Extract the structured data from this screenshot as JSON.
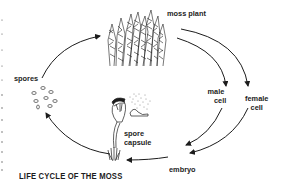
{
  "diagram": {
    "title": "LIFE CYCLE OF THE MOSS",
    "stages": [
      {
        "id": "moss-plant",
        "label": "moss plant"
      },
      {
        "id": "male-cell",
        "label_line1": "male",
        "label_line2": "cell"
      },
      {
        "id": "female-cell",
        "label_line1": "female",
        "label_line2": "cell"
      },
      {
        "id": "embryo",
        "label": "embryo"
      },
      {
        "id": "spore-capsule",
        "label_line1": "spore",
        "label_line2": "capsule"
      },
      {
        "id": "spores",
        "label": "spores"
      }
    ],
    "flow": [
      "moss plant -> male cell",
      "moss plant -> female cell",
      "male cell -> embryo",
      "female cell -> embryo",
      "embryo -> spore capsule",
      "spore capsule -> spores",
      "spores -> moss plant"
    ],
    "colors": {
      "ink": "#1c1c1c",
      "background": "#ffffff"
    }
  }
}
